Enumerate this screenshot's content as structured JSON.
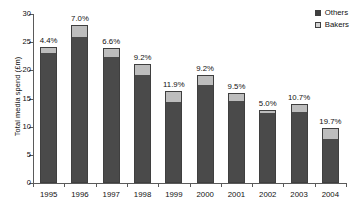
{
  "chart_data": {
    "type": "bar",
    "title": "",
    "xlabel": "",
    "ylabel": "Total media spend (£m)",
    "ylim": [
      0,
      30
    ],
    "ytick_values": [
      0,
      5,
      10,
      15,
      20,
      25,
      30
    ],
    "ytick_labels": [
      "0",
      "5",
      "10",
      "15",
      "20",
      "25",
      "30"
    ],
    "grid": false,
    "legend_position": "top-right",
    "stacked": true,
    "categories": [
      "1995",
      "1996",
      "1997",
      "1998",
      "1999",
      "2000",
      "2001",
      "2002",
      "2003",
      "2004"
    ],
    "series": [
      {
        "name": "Others",
        "values": [
          23.1,
          26.0,
          22.3,
          19.2,
          14.4,
          17.4,
          14.5,
          12.4,
          12.6,
          7.9
        ]
      },
      {
        "name": "Bakers",
        "values": [
          1.1,
          2.0,
          1.6,
          2.0,
          2.0,
          1.8,
          1.5,
          0.6,
          1.5,
          1.9
        ]
      }
    ],
    "totals": [
      24.2,
      28.0,
      23.9,
      21.2,
      16.4,
      19.2,
      16.0,
      13.0,
      14.1,
      9.8
    ],
    "annotations": [
      "4.4%",
      "7.0%",
      "6.6%",
      "9.2%",
      "11.9%",
      "9.2%",
      "9.5%",
      "5.0%",
      "10.7%",
      "19.7%"
    ],
    "annotation_note": "Bakers share of total media spend",
    "colors": {
      "others": "#4a4a4a",
      "bakers": "#bdbdbd",
      "axis": "#5a5a5a",
      "text": "#111111",
      "background": "#ffffff"
    }
  },
  "legend": {
    "items": [
      {
        "label": "Others",
        "swatch": "dark-square-icon"
      },
      {
        "label": "Bakers",
        "swatch": "light-square-icon"
      }
    ]
  }
}
